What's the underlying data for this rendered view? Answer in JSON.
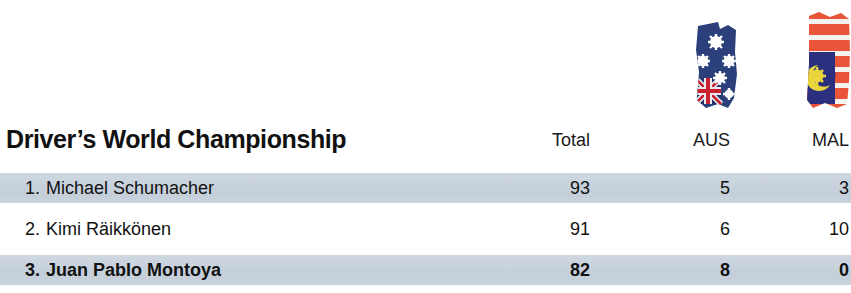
{
  "title": "Driver’s World Championship",
  "columns": [
    {
      "key": "total",
      "label": "Total",
      "flag": null
    },
    {
      "key": "aus",
      "label": "AUS",
      "flag": "australia-flag"
    },
    {
      "key": "mal",
      "label": "MAL",
      "flag": "malaysia-flag"
    }
  ],
  "rows": [
    {
      "rank": "1.",
      "driver": "Michael Schumacher",
      "total": "93",
      "aus": "5",
      "mal": "3",
      "banded": true,
      "bold": false
    },
    {
      "rank": "2.",
      "driver": "Kimi Räikkönen",
      "total": "91",
      "aus": "6",
      "mal": "10",
      "banded": false,
      "bold": false
    },
    {
      "rank": "3.",
      "driver": "Juan Pablo Montoya",
      "total": "82",
      "aus": "8",
      "mal": "0",
      "banded": true,
      "bold": true
    }
  ],
  "colors": {
    "background": "#ffffff",
    "row_band": "#c9d3de",
    "text": "#111111",
    "aus_flag_blue": "#2b3f7a",
    "aus_flag_star": "#ffffff",
    "aus_flag_red": "#c8202e",
    "mal_flag_red": "#e8553a",
    "mal_flag_white": "#f4f2ee",
    "mal_flag_blue": "#2b2f7e",
    "mal_flag_yellow": "#e8d43c"
  }
}
